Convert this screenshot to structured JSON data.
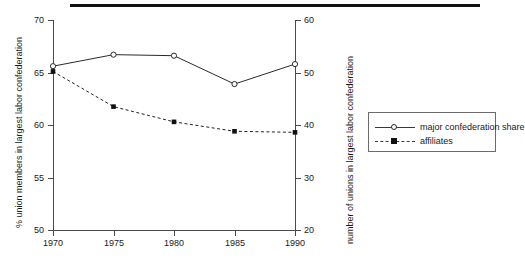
{
  "chart_data": {
    "type": "line",
    "title": "",
    "subtitle": "",
    "xlabel": "",
    "ylabel": "% union members in largest labor confederation",
    "y2label": "number of unions in largest labor confederation",
    "categories": [
      "1970",
      "1975",
      "1980",
      "1985",
      "1990"
    ],
    "x": [
      1970,
      1975,
      1980,
      1985,
      1990
    ],
    "ylim": [
      50,
      70
    ],
    "y2lim": [
      20,
      60
    ],
    "yticks": [
      "50",
      "55",
      "60",
      "65",
      "70"
    ],
    "y2ticks": [
      "20",
      "30",
      "40",
      "50",
      "60"
    ],
    "xticks": [
      "1970",
      "1975",
      "1980",
      "1985",
      "1990"
    ],
    "grid": false,
    "legend_position": "right",
    "series": [
      {
        "name": "major confederation share",
        "axis": "left",
        "marker": "open-circle",
        "linestyle": "solid",
        "color": "#2a2a2a",
        "values": [
          65.6,
          66.7,
          66.6,
          63.9,
          65.8
        ]
      },
      {
        "name": "affiliates",
        "axis": "right",
        "marker": "filled-square",
        "linestyle": "dashed",
        "color": "#111111",
        "values": [
          50.2,
          43.5,
          40.6,
          38.8,
          38.6
        ]
      }
    ]
  },
  "axes": {
    "left": {
      "title": "% union members in largest labor confederation",
      "tick_labels": [
        "70",
        "65",
        "60",
        "55",
        "50"
      ]
    },
    "right": {
      "title": "number of unions in largest labor confederation",
      "tick_labels": [
        "60",
        "50",
        "40",
        "30",
        "20"
      ]
    },
    "bottom": {
      "tick_labels": [
        "1970",
        "1975",
        "1980",
        "1985",
        "1990"
      ]
    }
  },
  "legend": {
    "entries": [
      {
        "label": "major confederation share"
      },
      {
        "label": "affiliates"
      }
    ]
  }
}
